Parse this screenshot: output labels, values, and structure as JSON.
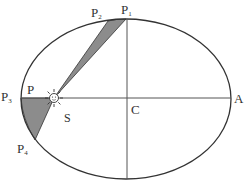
{
  "diagram": {
    "labels": {
      "p1": "P",
      "p1_sub": "1",
      "p2": "P",
      "p2_sub": "2",
      "p3": "P",
      "p3_sub": "3",
      "p4": "P",
      "p4_sub": "4",
      "p": "P",
      "a": "A",
      "c": "C",
      "s": "S"
    },
    "colors": {
      "stroke": "#333333",
      "shaded": "#888888",
      "background": "#ffffff"
    },
    "ellipse": {
      "cx": 126,
      "cy": 99,
      "rx": 106,
      "ry": 80
    },
    "sun": {
      "x": 54,
      "y": 98,
      "icon": "sun-icon"
    }
  }
}
